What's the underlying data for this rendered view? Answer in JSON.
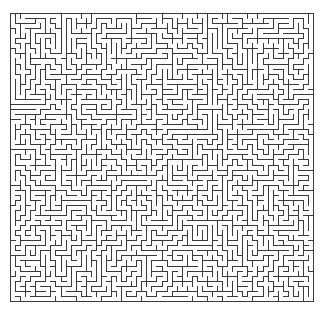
{
  "figure": {
    "type": "maze",
    "title": "",
    "background_color": "#ffffff"
  },
  "maze": {
    "label": "rectangular perfect maze",
    "algorithm": "depth-first-search spanning tree",
    "columns": 60,
    "rows": 57,
    "cell_size_px": 5.05,
    "origin_x_px": 10,
    "origin_y_px": 13,
    "width_px": 303,
    "height_px": 288,
    "wall_color": "#3a3a3a",
    "wall_width_px": 1,
    "border_color": "#3a3a3a",
    "border_width_px": 1,
    "passage_color": "#ffffff",
    "border_closed_top": true,
    "border_closed_bottom": true,
    "border_closed_left": true,
    "border_closed_right": true,
    "entrance": null,
    "exit": null,
    "random_seed": 20240607
  },
  "chart_data": {
    "type": "maze",
    "title": "",
    "xlabel": "",
    "ylabel": "",
    "grid": false,
    "legend": null,
    "columns": 60,
    "rows": 57,
    "cell_size_px": 5.05,
    "wall_color": "#3a3a3a",
    "background": "#ffffff",
    "xlim": [
      0,
      60
    ],
    "ylim": [
      0,
      57
    ]
  }
}
